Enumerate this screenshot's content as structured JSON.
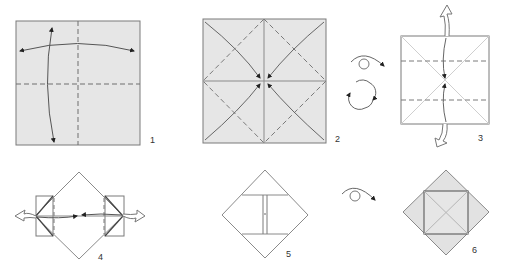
{
  "diagram": {
    "type": "origami-instructions",
    "colors": {
      "paper_colored": "#e6e6e6",
      "paper_white": "#ffffff",
      "line": "#7a7a7a",
      "arrow": "#555555",
      "arrowhead": "#222222"
    },
    "steps": [
      {
        "number": "1",
        "description": "Square, colored side up; valley-fold in half both ways and unfold"
      },
      {
        "number": "2",
        "description": "Diagonal valley creases; fold corners to center"
      },
      {
        "number": "3",
        "description": "Turn over; fold top and bottom edges to center and unfold"
      },
      {
        "number": "4",
        "description": "Pull out flaps at sides"
      },
      {
        "number": "5",
        "description": "Flattened diamond with center flaps"
      },
      {
        "number": "6",
        "description": "Turn over; finished"
      }
    ],
    "symbols": {
      "turn_over": "turn-over-icon",
      "rotate": "rotate-icon"
    }
  }
}
